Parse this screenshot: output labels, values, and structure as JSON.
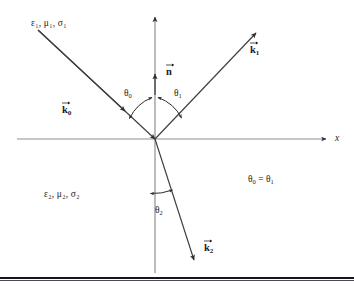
{
  "figure": {
    "background_color": "#ffffff",
    "axis_color": "#8a8a8a",
    "ray_color": "#3a3a3a",
    "text_color": "#1c1c1c",
    "arc_color": "#2b2b2b"
  },
  "axes": {
    "x_label": "x",
    "y_label": "",
    "x_axis_name": "horizontal-interface-axis",
    "y_axis_name": "vertical-normal-axis"
  },
  "media": {
    "upper": "ε₁, μ₁, σ₁",
    "lower": "ε₂, μ₂, σ₂"
  },
  "vectors": {
    "normal": "n",
    "incident": "k",
    "incident_sub": "0",
    "reflected": "k",
    "reflected_sub": "1",
    "transmitted": "k",
    "transmitted_sub": "2"
  },
  "angles": {
    "incident": "θ",
    "incident_sub": "0",
    "reflected": "θ",
    "reflected_sub": "1",
    "transmitted": "θ",
    "transmitted_sub": "2"
  },
  "relation": {
    "text": "θ",
    "sub_left": "0",
    "equals": " = θ",
    "sub_right": "1"
  },
  "geometry": {
    "origin": [
      155,
      139
    ],
    "incident_ray_start": [
      38,
      30
    ],
    "reflected_ray_end": [
      258,
      31
    ],
    "transmitted_ray_end": [
      195,
      262
    ],
    "y_axis_top": [
      155,
      13
    ],
    "y_axis_bottom": [
      155,
      273
    ],
    "x_axis_left": [
      17,
      139
    ],
    "x_axis_right": [
      330,
      139
    ]
  }
}
